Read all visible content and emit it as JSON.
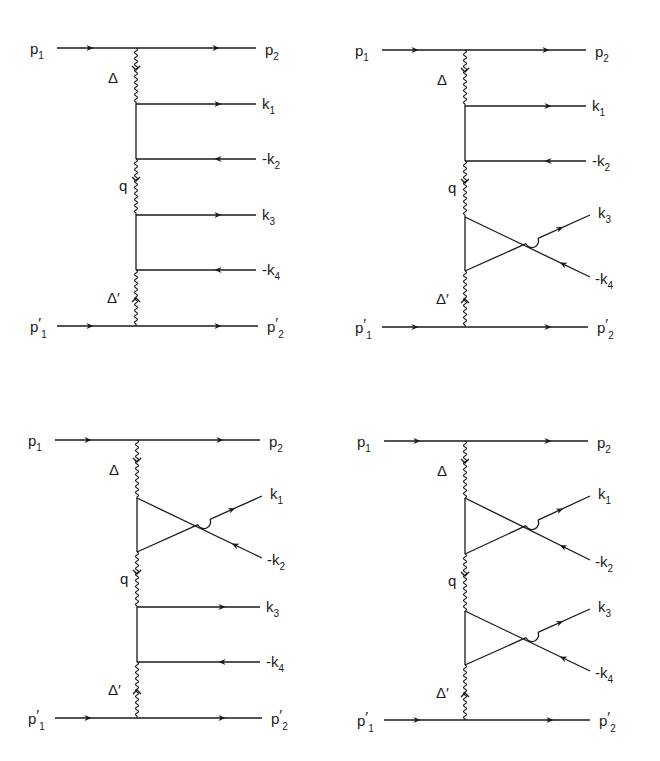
{
  "figure": {
    "diagrams": [
      {
        "id": "top-left",
        "origin": [
          0,
          0
        ],
        "spine_x": 136,
        "top_y": 48,
        "bottom_y": 326,
        "left_x": 57,
        "right_x": 256,
        "pairs": [
          {
            "type": "direct",
            "y1": 104,
            "y2": 159
          },
          {
            "type": "direct",
            "y1": 215,
            "y2": 270
          }
        ],
        "labels": {
          "p1": "p",
          "p1_sub": "1",
          "p2": "p",
          "p2_sub": "2",
          "p1p": "p",
          "p1p_sub": "1",
          "p1p_prime": "′",
          "p2p": "p",
          "p2p_sub": "2",
          "p2p_prime": "′",
          "delta": "Δ",
          "q": "q",
          "delta_p": "Δ′",
          "k1": "k",
          "k1_sub": "1",
          "k2": "-k",
          "k2_sub": "2",
          "k3": "k",
          "k3_sub": "3",
          "k4": "-k",
          "k4_sub": "4"
        }
      },
      {
        "id": "top-right",
        "origin": [
          330,
          0
        ],
        "spine_x": 135,
        "top_y": 50,
        "bottom_y": 327,
        "left_x": 52,
        "right_x": 256,
        "pairs": [
          {
            "type": "direct",
            "y1": 106,
            "y2": 161
          },
          {
            "type": "crossed",
            "y1": 217,
            "y2": 271
          }
        ],
        "labels": {
          "p1": "p",
          "p1_sub": "1",
          "p2": "p",
          "p2_sub": "2",
          "p1p": "p",
          "p1p_sub": "1",
          "p1p_prime": "′",
          "p2p": "p",
          "p2p_sub": "2",
          "p2p_prime": "′",
          "delta": "Δ",
          "q": "q",
          "delta_p": "Δ′",
          "k1": "k",
          "k1_sub": "1",
          "k2": "-k",
          "k2_sub": "2",
          "k3": "k",
          "k3_sub": "3",
          "k4": "-k",
          "k4_sub": "4"
        }
      },
      {
        "id": "bottom-left",
        "origin": [
          0,
          400
        ],
        "spine_x": 137,
        "top_y": 40,
        "bottom_y": 318,
        "left_x": 55,
        "right_x": 260,
        "pairs": [
          {
            "type": "crossed",
            "y1": 98,
            "y2": 152
          },
          {
            "type": "direct",
            "y1": 207,
            "y2": 262
          }
        ],
        "labels": {
          "p1": "p",
          "p1_sub": "1",
          "p2": "p",
          "p2_sub": "2",
          "p1p": "p",
          "p1p_sub": "1",
          "p1p_prime": "′",
          "p2p": "p",
          "p2p_sub": "2",
          "p2p_prime": "′",
          "delta": "Δ",
          "q": "q",
          "delta_p": "Δ′",
          "k1": "k",
          "k1_sub": "1",
          "k2": "-k",
          "k2_sub": "2",
          "k3": "k",
          "k3_sub": "3",
          "k4": "-k",
          "k4_sub": "4"
        }
      },
      {
        "id": "bottom-right",
        "origin": [
          330,
          400
        ],
        "spine_x": 135,
        "top_y": 41,
        "bottom_y": 320,
        "left_x": 54,
        "right_x": 258,
        "pairs": [
          {
            "type": "crossed",
            "y1": 98,
            "y2": 154
          },
          {
            "type": "crossed",
            "y1": 211,
            "y2": 265
          }
        ],
        "labels": {
          "p1": "p",
          "p1_sub": "1",
          "p2": "p",
          "p2_sub": "2",
          "p1p": "p",
          "p1p_sub": "1",
          "p1p_prime": "′",
          "p2p": "p",
          "p2p_sub": "2",
          "p2p_prime": "′",
          "delta": "Δ",
          "q": "q",
          "delta_p": "Δ′",
          "k1": "k",
          "k1_sub": "1",
          "k2": "-k",
          "k2_sub": "2",
          "k3": "k",
          "k3_sub": "3",
          "k4": "-k",
          "k4_sub": "4"
        }
      }
    ],
    "colors": {
      "ink": "#1a1a1a",
      "background": "#ffffff"
    }
  }
}
